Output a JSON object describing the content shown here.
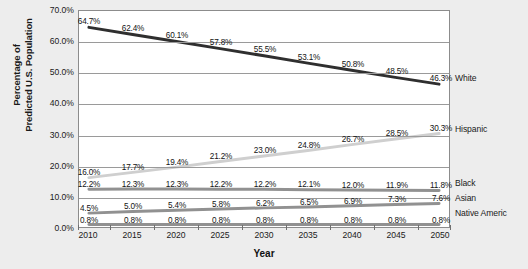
{
  "chart_data": {
    "type": "line",
    "title": "",
    "xlabel": "Year",
    "ylabel_line1": "Percentage of",
    "ylabel_line2": "Predicted U.S. Population",
    "categories": [
      "2010",
      "2015",
      "2020",
      "2025",
      "2030",
      "2035",
      "2040",
      "2045",
      "2050"
    ],
    "ylim": [
      0,
      70
    ],
    "yticks": [
      "0.0%",
      "10.0%",
      "20.0%",
      "30.0%",
      "40.0%",
      "50.0%",
      "60.0%",
      "70.0%"
    ],
    "ytick_values": [
      0,
      10,
      20,
      30,
      40,
      50,
      60,
      70
    ],
    "grid": true,
    "legend_position": "right",
    "series": [
      {
        "name": "White",
        "color": "#2f2f2f",
        "values": [
          64.7,
          62.4,
          60.1,
          57.8,
          55.5,
          53.1,
          50.8,
          48.5,
          46.3
        ],
        "labels": [
          "64.7%",
          "62.4%",
          "60.1%",
          "57.8%",
          "55.5%",
          "53.1%",
          "50.8%",
          "48.5%",
          "46.3%"
        ]
      },
      {
        "name": "Hispanic",
        "color": "#cfcfcf",
        "values": [
          16.0,
          17.7,
          19.4,
          21.2,
          23.0,
          24.8,
          26.7,
          28.5,
          30.3
        ],
        "labels": [
          "16.0%",
          "17.7%",
          "19.4%",
          "21.2%",
          "23.0%",
          "24.8%",
          "26.7%",
          "28.5%",
          "30.3%"
        ]
      },
      {
        "name": "Black",
        "color": "#919191",
        "values": [
          12.2,
          12.3,
          12.3,
          12.2,
          12.2,
          12.1,
          12.0,
          11.9,
          11.8
        ],
        "labels": [
          "12.2%",
          "12.3%",
          "12.3%",
          "12.2%",
          "12.2%",
          "12.1%",
          "12.0%",
          "11.9%",
          "11.8%"
        ]
      },
      {
        "name": "Asian",
        "color": "#919191",
        "values": [
          4.5,
          5.0,
          5.4,
          5.8,
          6.2,
          6.5,
          6.9,
          7.3,
          7.6
        ],
        "labels": [
          "4.5%",
          "5.0%",
          "5.4%",
          "5.8%",
          "6.2%",
          "6.5%",
          "6.9%",
          "7.3%",
          "7.6%"
        ]
      },
      {
        "name": "Native Americ",
        "color": "#919191",
        "values": [
          0.8,
          0.8,
          0.8,
          0.8,
          0.8,
          0.8,
          0.8,
          0.8,
          0.8
        ],
        "labels": [
          "0.8%",
          "0.8%",
          "0.8%",
          "0.8%",
          "0.8%",
          "0.8%",
          "0.8%",
          "0.8%",
          "0.8%"
        ]
      }
    ],
    "legend": [
      {
        "label": "White",
        "y": 78
      },
      {
        "label": "Hispanic",
        "y": 129
      },
      {
        "label": "Black",
        "y": 183
      },
      {
        "label": "Asian",
        "y": 198
      },
      {
        "label": "Native Americ",
        "y": 213
      }
    ]
  }
}
